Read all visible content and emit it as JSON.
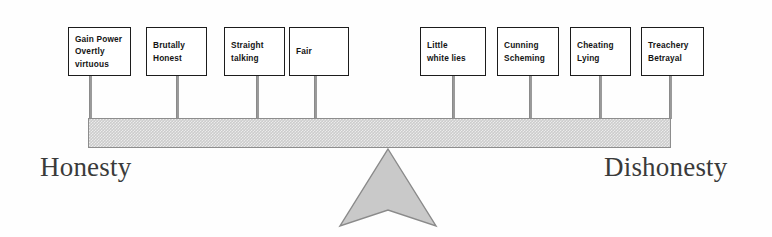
{
  "diagram": {
    "beam": {
      "fill_color": "#cccccc",
      "border_color": "#8d8d8d"
    },
    "fulcrum": {
      "shape": "arrow-up",
      "fill_color": "#c9c9c9",
      "border_color": "#8a8a8a"
    },
    "end_labels": {
      "left": "Honesty",
      "right": "Dishonesty"
    },
    "nodes": [
      {
        "id": "gain-power-overtly-virtuous",
        "lines": [
          "Gain Power",
          "Overtly",
          "virtuous"
        ],
        "x": 68,
        "y": 27,
        "w": 63,
        "h": 49,
        "stem_x": 89
      },
      {
        "id": "brutally-honest",
        "lines": [
          "Brutally",
          "Honest"
        ],
        "x": 146,
        "y": 27,
        "w": 61,
        "h": 49,
        "stem_x": 176
      },
      {
        "id": "straight-talking",
        "lines": [
          "Straight",
          "talking"
        ],
        "x": 224,
        "y": 27,
        "w": 61,
        "h": 49,
        "stem_x": 256
      },
      {
        "id": "fair",
        "lines": [
          "Fair"
        ],
        "x": 289,
        "y": 27,
        "w": 60,
        "h": 49,
        "stem_x": 314
      },
      {
        "id": "little-white-lies",
        "lines": [
          "Little",
          "white lies"
        ],
        "x": 420,
        "y": 27,
        "w": 66,
        "h": 49,
        "stem_x": 452
      },
      {
        "id": "cunning-scheming",
        "lines": [
          "Cunning",
          "Scheming"
        ],
        "x": 497,
        "y": 27,
        "w": 62,
        "h": 49,
        "stem_x": 529
      },
      {
        "id": "cheating-lying",
        "lines": [
          "Cheating",
          "Lying"
        ],
        "x": 570,
        "y": 27,
        "w": 61,
        "h": 49,
        "stem_x": 599
      },
      {
        "id": "treachery-betrayal",
        "lines": [
          "Treachery",
          "Betrayal"
        ],
        "x": 641,
        "y": 27,
        "w": 63,
        "h": 49,
        "stem_x": 669
      }
    ]
  }
}
